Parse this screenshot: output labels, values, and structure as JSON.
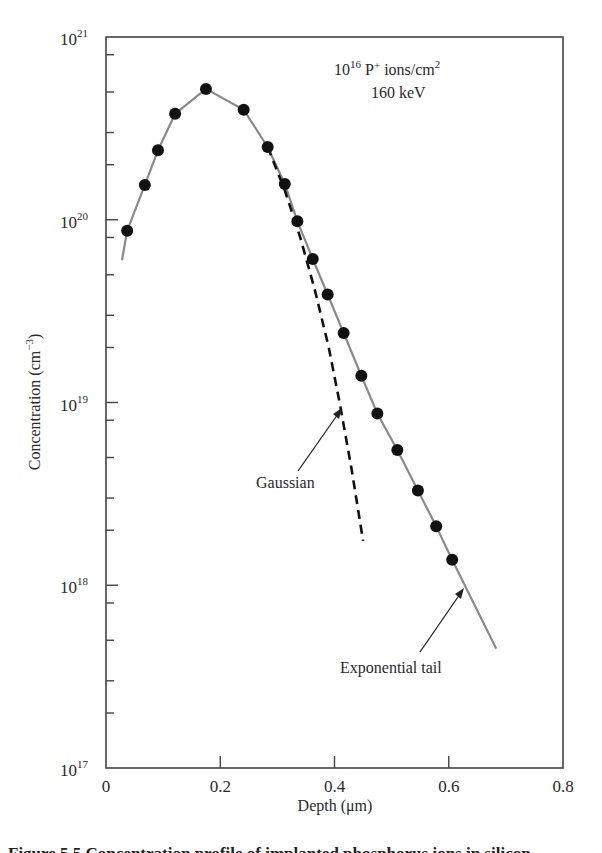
{
  "chart_data": {
    "type": "scatter",
    "annotation_lines": [
      "10",
      "16",
      " P",
      "+",
      " ions/cm",
      "2",
      "160 keV"
    ],
    "xlabel": "Depth (μm)",
    "ylabel": "Concentration (cm",
    "ylabel_sup": "−3",
    "ylabel_close": ")",
    "xlim": [
      0,
      0.8
    ],
    "ylim": [
      1e+17,
      1e+21
    ],
    "yscale": "log",
    "grid": false,
    "x_ticks": [
      "0",
      "0.2",
      "0.4",
      "0.6",
      "0.8"
    ],
    "y_ticks": [
      {
        "base": "10",
        "exp": "21"
      },
      {
        "base": "10",
        "exp": "20"
      },
      {
        "base": "10",
        "exp": "19"
      },
      {
        "base": "10",
        "exp": "18"
      },
      {
        "base": "10",
        "exp": "17"
      }
    ],
    "series": [
      {
        "name": "Measured data",
        "style": "filled black circles",
        "x": [
          0.037,
          0.068,
          0.091,
          0.121,
          0.175,
          0.241,
          0.283,
          0.313,
          0.335,
          0.362,
          0.388,
          0.416,
          0.447,
          0.475,
          0.51,
          0.546,
          0.578,
          0.606
        ],
        "y": [
          8.7e+19,
          1.55e+20,
          2.4e+20,
          3.8e+20,
          5.2e+20,
          4e+20,
          2.5e+20,
          1.57e+20,
          9.8e+19,
          6.1e+19,
          3.9e+19,
          2.4e+19,
          1.4e+19,
          8.7e+18,
          5.5e+18,
          3.3e+18,
          2.1e+18,
          1.38e+18
        ]
      },
      {
        "name": "Fit (with exponential tail)",
        "style": "solid gray line",
        "x": [
          0.028,
          0.037,
          0.068,
          0.091,
          0.121,
          0.175,
          0.241,
          0.283,
          0.313,
          0.335,
          0.362,
          0.388,
          0.416,
          0.447,
          0.475,
          0.51,
          0.546,
          0.578,
          0.606,
          0.683
        ],
        "y": [
          6e+19,
          8.7e+19,
          1.55e+20,
          2.4e+20,
          3.8e+20,
          5.2e+20,
          4e+20,
          2.5e+20,
          1.57e+20,
          9.8e+19,
          6.1e+19,
          3.9e+19,
          2.4e+19,
          1.4e+19,
          8.7e+18,
          5.5e+18,
          3.3e+18,
          2.1e+18,
          1.38e+18,
          4.5e+17
        ]
      },
      {
        "name": "Gaussian",
        "style": "dashed black line",
        "x": [
          0.283,
          0.313,
          0.34,
          0.365,
          0.39,
          0.41,
          0.43,
          0.45
        ],
        "y": [
          2.5e+20,
          1.45e+20,
          8e+19,
          4.2e+19,
          2e+19,
          9.6e+18,
          4.3e+18,
          1.75e+18
        ]
      }
    ],
    "annotations": [
      {
        "text": "Gaussian",
        "arrow_to": {
          "x": 0.41,
          "y": 9.6e+18
        }
      },
      {
        "text": "Exponential tail",
        "arrow_to": {
          "x": 0.625,
          "y": 1.05e+18
        }
      }
    ]
  },
  "caption": "Figure 5.5   Concentration profile of implanted phosphorus ions in silicon"
}
